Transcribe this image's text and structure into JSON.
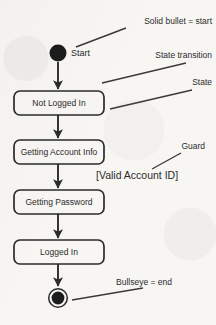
{
  "diagram": {
    "type": "uml-state-machine",
    "colors": {
      "background": "#f7f6f3",
      "stroke": "#2b2b2b",
      "node_fill": "#1c1c1c",
      "box_fill": "#f7f6f3",
      "text": "#2b2b2b"
    },
    "start_node": {
      "label": "Start",
      "shape": "solid-bullet",
      "cx": 58,
      "cy": 53,
      "r": 8.5
    },
    "end_node": {
      "shape": "bullseye",
      "cx": 58,
      "cy": 298,
      "r_outer": 9.5,
      "r_inner": 6.5
    },
    "states": [
      {
        "label": "Not Logged In",
        "x": 14,
        "y": 91,
        "w": 90,
        "h": 24
      },
      {
        "label": "Getting Account Info",
        "x": 14,
        "y": 140,
        "w": 90,
        "h": 24
      },
      {
        "label": "Getting Password",
        "x": 14,
        "y": 190,
        "w": 90,
        "h": 24
      },
      {
        "label": "Logged In",
        "x": 14,
        "y": 240,
        "w": 90,
        "h": 24
      }
    ],
    "transitions": [
      {
        "from": "Start",
        "to": "Not Logged In",
        "x": 58,
        "y1": 62,
        "y2": 90
      },
      {
        "from": "Not Logged In",
        "to": "Getting Account Info",
        "x": 58,
        "y1": 115,
        "y2": 139
      },
      {
        "from": "Getting Account Info",
        "to": "Getting Password",
        "x": 58,
        "y1": 164,
        "y2": 189
      },
      {
        "from": "Getting Password",
        "to": "Logged In",
        "x": 58,
        "y1": 214,
        "y2": 239
      },
      {
        "from": "Logged In",
        "to": "end",
        "x": 58,
        "y1": 264,
        "y2": 287
      }
    ],
    "guard": {
      "text": "[Valid Account ID]",
      "x": 96,
      "y": 179
    },
    "annotations": [
      {
        "label": "Solid bullet = start",
        "text_x": 212,
        "text_y": 24,
        "anchor": "end",
        "leader": {
          "x1": 76,
          "y1": 47,
          "x2": 126,
          "y2": 28
        }
      },
      {
        "label": "State transition",
        "text_x": 212,
        "text_y": 58,
        "anchor": "end",
        "leader": {
          "x1": 102,
          "y1": 83,
          "x2": 186,
          "y2": 63
        }
      },
      {
        "label": "State",
        "text_x": 212,
        "text_y": 85,
        "anchor": "end",
        "leader": {
          "x1": 110,
          "y1": 109,
          "x2": 192,
          "y2": 90
        }
      },
      {
        "label": "Guard",
        "text_x": 205,
        "text_y": 149,
        "anchor": "end",
        "leader": {
          "x1": 152,
          "y1": 169,
          "x2": 181,
          "y2": 153
        }
      },
      {
        "label": "Bullseye = end",
        "text_x": 172,
        "text_y": 285,
        "anchor": "end",
        "leader": {
          "x1": 72,
          "y1": 300,
          "x2": 143,
          "y2": 288
        }
      }
    ]
  }
}
